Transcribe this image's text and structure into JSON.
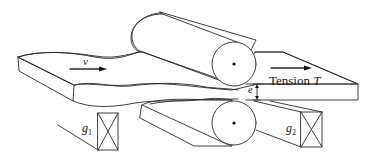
{
  "figure": {
    "labels": {
      "velocity": "v",
      "tension_prefix": "Tension ",
      "tension_symbol": "T",
      "thickness": "e",
      "gauge1_symbol": "g",
      "gauge1_sub": "1",
      "gauge2_symbol": "g",
      "gauge2_sub": "2"
    },
    "colors": {
      "line": "#2a2a2a",
      "background": "#ffffff"
    }
  }
}
